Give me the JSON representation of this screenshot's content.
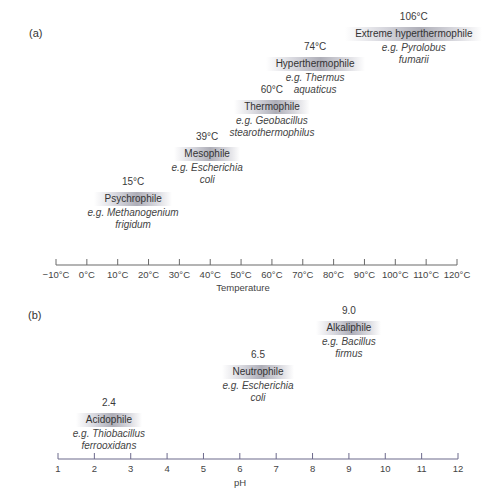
{
  "panels": [
    {
      "label": "(a)",
      "axis_title": "Temperature",
      "ticks": [
        "−10°C",
        "0°C",
        "10°C",
        "20°C",
        "30°C",
        "40°C",
        "50°C",
        "60°C",
        "70°C",
        "80°C",
        "90°C",
        "100°C",
        "110°C",
        "120°C"
      ],
      "markers": [
        {
          "value_label": "15°C",
          "name": "Psychrophile",
          "example_line1": "e.g. Methanogenium",
          "example_line2": "frigidum"
        },
        {
          "value_label": "39°C",
          "name": "Mesophile",
          "example_line1": "e.g. Escherichia",
          "example_line2": "coli"
        },
        {
          "value_label": "60°C",
          "name": "Thermophile",
          "example_line1": "e.g. Geobacillus",
          "example_line2": "stearothermophilus"
        },
        {
          "value_label": "74°C",
          "name": "Hyperthermophile",
          "example_line1": "e.g. Thermus",
          "example_line2": "aquaticus"
        },
        {
          "value_label": "106°C",
          "name": "Extreme hyperthermophile",
          "example_line1": "e.g. Pyrolobus",
          "example_line2": "fumarii"
        }
      ]
    },
    {
      "label": "(b)",
      "axis_title": "pH",
      "ticks": [
        "1",
        "2",
        "3",
        "4",
        "5",
        "6",
        "7",
        "8",
        "9",
        "10",
        "11",
        "12"
      ],
      "markers": [
        {
          "value_label": "2.4",
          "name": "Acidophile",
          "example_line1": "e.g. Thiobacillus",
          "example_line2": "ferrooxidans"
        },
        {
          "value_label": "6.5",
          "name": "Neutrophile",
          "example_line1": "e.g. Escherichia",
          "example_line2": "coli"
        },
        {
          "value_label": "9.0",
          "name": "Alkaliphile",
          "example_line1": "e.g. Bacillus",
          "example_line2": "firmus"
        }
      ]
    }
  ],
  "chart_data": [
    {
      "type": "scatter",
      "title": "(a)",
      "xlabel": "Temperature",
      "xlim": [
        -10,
        120
      ],
      "x_unit": "°C",
      "points": [
        {
          "x": 15,
          "label": "Psychrophile",
          "example": "Methanogenium frigidum"
        },
        {
          "x": 39,
          "label": "Mesophile",
          "example": "Escherichia coli"
        },
        {
          "x": 60,
          "label": "Thermophile",
          "example": "Geobacillus stearothermophilus"
        },
        {
          "x": 74,
          "label": "Hyperthermophile",
          "example": "Thermus aquaticus"
        },
        {
          "x": 106,
          "label": "Extreme hyperthermophile",
          "example": "Pyrolobus fumarii"
        }
      ]
    },
    {
      "type": "scatter",
      "title": "(b)",
      "xlabel": "pH",
      "xlim": [
        1,
        12
      ],
      "points": [
        {
          "x": 2.4,
          "label": "Acidophile",
          "example": "Thiobacillus ferrooxidans"
        },
        {
          "x": 6.5,
          "label": "Neutrophile",
          "example": "Escherichia coli"
        },
        {
          "x": 9.0,
          "label": "Alkaliphile",
          "example": "Bacillus firmus"
        }
      ]
    }
  ]
}
